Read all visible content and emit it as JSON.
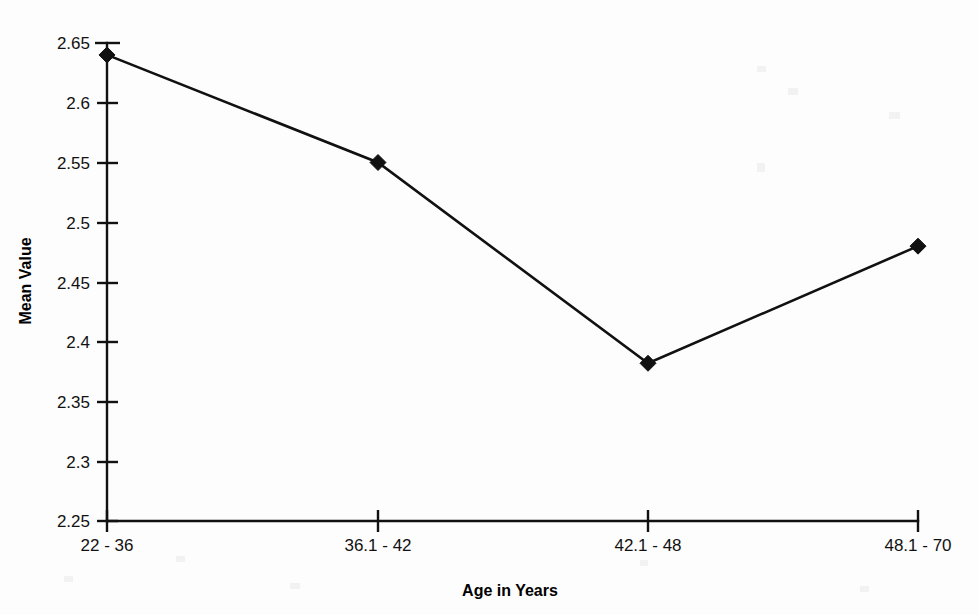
{
  "chart_data": {
    "type": "line",
    "title": "",
    "xlabel": "Age in Years",
    "ylabel": "Mean Value",
    "categories": [
      "22 - 36",
      "36.1 - 42",
      "42.1 - 48",
      "48.1 - 70"
    ],
    "values": [
      2.64,
      2.55,
      2.382,
      2.48
    ],
    "ylim": [
      2.25,
      2.65
    ],
    "ytick_labels": [
      "2.65",
      "2.6",
      "2.55",
      "2.5",
      "2.45",
      "2.4",
      "2.35",
      "2.3",
      "2.25"
    ],
    "ytick_values": [
      2.65,
      2.6,
      2.55,
      2.5,
      2.45,
      2.4,
      2.35,
      2.3,
      2.25
    ],
    "grid": false,
    "legend": false,
    "marker": "diamond",
    "series_color": "#111111"
  },
  "axes": {
    "x_title": "Age in Years",
    "y_title": "Mean Value"
  }
}
